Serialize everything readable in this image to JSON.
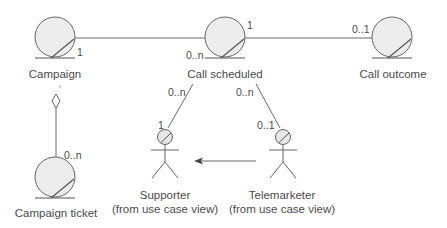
{
  "diagram": {
    "type": "UML class diagram (entity classes with associations)",
    "colors": {
      "line": "#6a6a6a",
      "entity_fill": "#ececec",
      "text": "#4a4a4a"
    },
    "entities": [
      {
        "id": "campaign",
        "label": "Campaign",
        "icon": "entity-class-icon"
      },
      {
        "id": "call_scheduled",
        "label": "Call scheduled",
        "icon": "entity-class-icon"
      },
      {
        "id": "call_outcome",
        "label": "Call outcome",
        "icon": "entity-class-icon"
      },
      {
        "id": "campaign_ticket",
        "label": "Campaign ticket",
        "icon": "entity-class-icon"
      }
    ],
    "actors": [
      {
        "id": "supporter",
        "label": "Supporter",
        "sublabel": "(from use case view)",
        "icon": "actor-entity-icon"
      },
      {
        "id": "telemarketer",
        "label": "Telemarketer",
        "sublabel": "(from use case view)",
        "icon": "actor-entity-icon"
      }
    ],
    "associations": [
      {
        "from": "Campaign",
        "to": "Call scheduled",
        "from_mult": "1",
        "to_mult": "0..n"
      },
      {
        "from": "Call scheduled",
        "to": "Call outcome",
        "from_mult": "1",
        "to_mult": "0..1"
      },
      {
        "from": "Call scheduled",
        "to": "Supporter",
        "from_mult": "0..n",
        "to_mult": "1"
      },
      {
        "from": "Call scheduled",
        "to": "Telemarketer",
        "from_mult": "0..n",
        "to_mult": "0..1"
      },
      {
        "from": "Campaign",
        "to": "Campaign ticket",
        "kind": "aggregation",
        "to_mult": "0..n"
      },
      {
        "from": "Telemarketer",
        "to": "Supporter",
        "kind": "generalization-arrow"
      }
    ],
    "multiplicities": {
      "campaign_right": "1",
      "call_scheduled_right": "1",
      "call_scheduled_left": "0..n",
      "call_outcome_left": "0..1",
      "scheduled_supporter_top": "0..n",
      "scheduled_telemarketer_top": "0..n",
      "supporter_end": "1",
      "telemarketer_end": "0..1",
      "campaign_ticket_end": "0..n"
    }
  }
}
